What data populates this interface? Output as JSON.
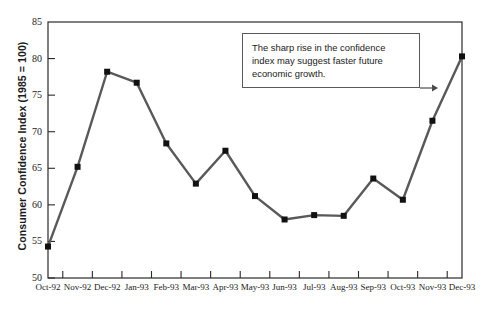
{
  "chart_data": {
    "type": "line",
    "title": "",
    "xlabel": "",
    "ylabel": "Consumer Confidence Index (1985 = 100)",
    "categories": [
      "Oct-92",
      "Nov-92",
      "Dec-92",
      "Jan-93",
      "Feb-93",
      "Mar-93",
      "Apr-93",
      "May-93",
      "Jun-93",
      "Jul-93",
      "Aug-93",
      "Sep-93",
      "Oct-93",
      "Nov-93",
      "Dec-93"
    ],
    "values": [
      54.3,
      65.2,
      78.2,
      76.7,
      68.4,
      62.9,
      67.4,
      61.2,
      58.0,
      58.6,
      58.5,
      63.6,
      60.7,
      71.5,
      80.3
    ],
    "ylim": [
      50,
      85
    ],
    "yticks": [
      50,
      55,
      60,
      65,
      70,
      75,
      80,
      85
    ],
    "ytick_labels": [
      "50",
      "55",
      "60",
      "65",
      "70",
      "75",
      "80",
      "85"
    ],
    "grid": false,
    "legend": "none",
    "series_color": "#595959",
    "marker": "square",
    "marker_color": "#111111",
    "annotations": [
      {
        "text": "The sharp rise in the confidence index may suggest faster future economic growth.",
        "arrow": "points-right-to-rising-segment"
      }
    ]
  },
  "axis": {
    "y_title": "Consumer Confidence Index (1985 = 100)"
  },
  "annotation": {
    "line1": "The sharp rise in the confidence",
    "line2": "index may suggest faster future",
    "line3": "economic growth."
  }
}
